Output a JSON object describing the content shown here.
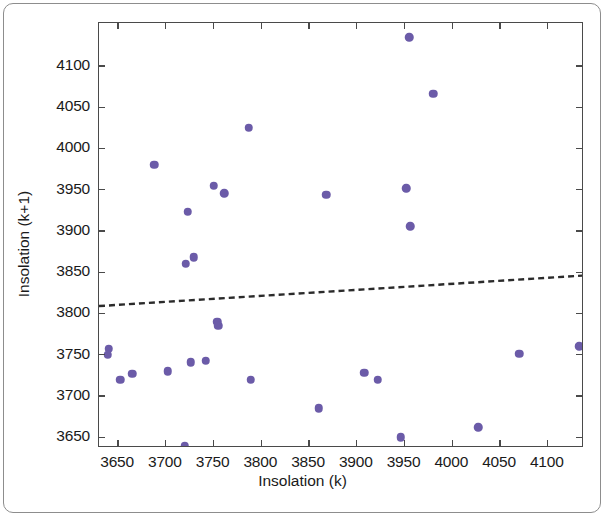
{
  "figure": {
    "x_axis_title": "Insolation (k)",
    "y_axis_title": "Insolation (k+1)",
    "marker_color": "#6b5ba8",
    "axis_color": "#4a4a4a",
    "trend_color": "#2b2b2b",
    "border_color": "#8d8d8d"
  },
  "chart_data": {
    "type": "scatter",
    "title": "",
    "xlabel": "Insolation (k)",
    "ylabel": "Insolation (k+1)",
    "xlim": [
      3630,
      4138
    ],
    "ylim": [
      3637,
      4152
    ],
    "xticks": [
      3650,
      3700,
      3750,
      3800,
      3850,
      3900,
      3950,
      4000,
      4050,
      4100
    ],
    "yticks": [
      3650,
      3700,
      3750,
      3800,
      3850,
      3900,
      3950,
      4000,
      4050,
      4100
    ],
    "xtick_labels": [
      "3650",
      "3700",
      "3750",
      "3800",
      "3850",
      "3900",
      "3950",
      "4000",
      "4050",
      "4100"
    ],
    "ytick_labels": [
      "3650",
      "3700",
      "3750",
      "3800",
      "3850",
      "3900",
      "3950",
      "4000",
      "4050",
      "4100"
    ],
    "grid": false,
    "legend": null,
    "marker_color": "#6b5ba8",
    "marker_size": 8.5,
    "points": [
      {
        "x": 3640,
        "y": 3757
      },
      {
        "x": 3639,
        "y": 3750
      },
      {
        "x": 3652,
        "y": 3720
      },
      {
        "x": 3665,
        "y": 3727
      },
      {
        "x": 3688,
        "y": 3980
      },
      {
        "x": 3702,
        "y": 3730
      },
      {
        "x": 3720,
        "y": 3639
      },
      {
        "x": 3721,
        "y": 3860
      },
      {
        "x": 3723,
        "y": 3923
      },
      {
        "x": 3726,
        "y": 3741
      },
      {
        "x": 3729,
        "y": 3868
      },
      {
        "x": 3742,
        "y": 3743
      },
      {
        "x": 3750,
        "y": 3955
      },
      {
        "x": 3754,
        "y": 3790
      },
      {
        "x": 3755,
        "y": 3785
      },
      {
        "x": 3761,
        "y": 3946
      },
      {
        "x": 3787,
        "y": 4025
      },
      {
        "x": 3789,
        "y": 3720
      },
      {
        "x": 3860,
        "y": 3685
      },
      {
        "x": 3868,
        "y": 3944
      },
      {
        "x": 3908,
        "y": 3728
      },
      {
        "x": 3922,
        "y": 3720
      },
      {
        "x": 3946,
        "y": 3650
      },
      {
        "x": 3952,
        "y": 3952
      },
      {
        "x": 3955,
        "y": 4135
      },
      {
        "x": 3956,
        "y": 3906
      },
      {
        "x": 3980,
        "y": 4066
      },
      {
        "x": 4027,
        "y": 3662
      },
      {
        "x": 4070,
        "y": 3751
      },
      {
        "x": 4133,
        "y": 3760
      }
    ],
    "trend_line": {
      "style": "dashed",
      "color": "#2b2b2b",
      "x_start": 3630,
      "y_start": 3809,
      "x_end": 4138,
      "y_end": 3846
    }
  }
}
